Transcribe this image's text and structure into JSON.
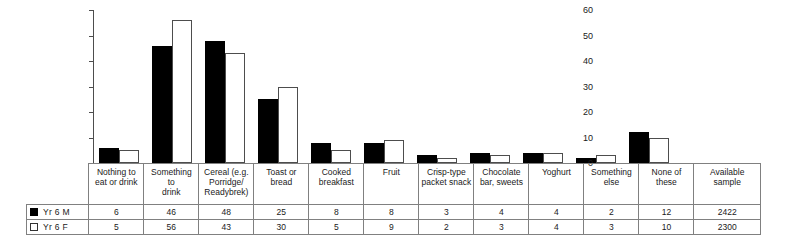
{
  "chart_data": {
    "type": "bar",
    "title": "",
    "subtitle": "",
    "xlabel": "",
    "ylabel": "",
    "ylim": [
      0,
      60
    ],
    "yticks": [
      0,
      10,
      20,
      30,
      40,
      50,
      60
    ],
    "grid": false,
    "legend_position": "table-left",
    "categories": [
      "Nothing to eat or drink",
      "Something to drink",
      "Cereal (e.g. Porridge/ Readybrek)",
      "Toast or bread",
      "Cooked breakfast",
      "Fruit",
      "Crisp-type packet snack",
      "Chocolate bar, sweets",
      "Yoghurt",
      "Something else",
      "None of these"
    ],
    "series": [
      {
        "name": "Yr 6 M",
        "values": [
          6,
          46,
          48,
          25,
          8,
          8,
          3,
          4,
          4,
          2,
          12
        ],
        "color": "#000000",
        "style": "filled"
      },
      {
        "name": "Yr 6 F",
        "values": [
          5,
          56,
          43,
          30,
          5,
          9,
          2,
          3,
          4,
          3,
          10
        ],
        "color": "#ffffff",
        "style": "hollow"
      }
    ],
    "available_sample": {
      "label": "Available sample",
      "values": [
        "2422",
        "2300"
      ]
    }
  },
  "table": {
    "headers": [
      "Nothing to eat or drink",
      "Something to drink",
      "Cereal (e.g. Porridge/ Readybrek)",
      "Toast or bread",
      "Cooked breakfast",
      "Fruit",
      "Crisp-type packet snack",
      "Chocolate bar, sweets",
      "Yoghurt",
      "Something else",
      "None of these",
      "Available sample"
    ],
    "header_lines": [
      [
        "Nothing to",
        "eat or drink"
      ],
      [
        "Something to",
        "drink"
      ],
      [
        "Cereal (e.g.",
        "Porridge/",
        "Readybrek)"
      ],
      [
        "Toast or",
        "bread"
      ],
      [
        "Cooked",
        "breakfast"
      ],
      [
        "Fruit"
      ],
      [
        "Crisp-type",
        "packet snack"
      ],
      [
        "Chocolate",
        "bar, sweets"
      ],
      [
        "Yoghurt"
      ],
      [
        "Something",
        "else"
      ],
      [
        "None of these"
      ],
      [
        "Available",
        "sample"
      ]
    ],
    "rows": [
      {
        "legend": "Yr 6 M",
        "swatch": "filled",
        "cells": [
          "6",
          "46",
          "48",
          "25",
          "8",
          "8",
          "3",
          "4",
          "4",
          "2",
          "12",
          "2422"
        ]
      },
      {
        "legend": "Yr 6 F",
        "swatch": "hollow",
        "cells": [
          "5",
          "56",
          "43",
          "30",
          "5",
          "9",
          "2",
          "3",
          "4",
          "3",
          "10",
          "2300"
        ]
      }
    ]
  },
  "axis": {
    "ticks": [
      "60",
      "50",
      "40",
      "30",
      "20",
      "10",
      "0"
    ]
  },
  "colors": {
    "male_bar": "#000000",
    "female_bar": "#ffffff",
    "bar_outline": "#4d4d4d",
    "grid_line": "#808080",
    "background": "#ffffff"
  }
}
